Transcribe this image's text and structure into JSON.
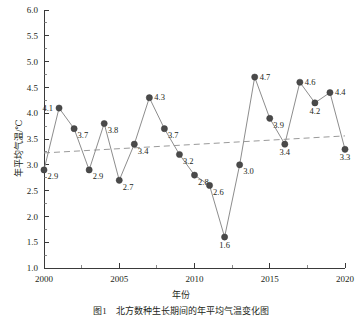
{
  "chart_data": {
    "type": "line",
    "title": "",
    "xlabel": "年份",
    "ylabel": "年平均气温/℃",
    "xlim": [
      2000,
      2020
    ],
    "ylim": [
      1.0,
      6.0
    ],
    "grid": false,
    "legend": "none",
    "x": [
      2000,
      2001,
      2002,
      2003,
      2004,
      2005,
      2006,
      2007,
      2008,
      2009,
      2010,
      2011,
      2012,
      2013,
      2014,
      2015,
      2016,
      2017,
      2018,
      2019,
      2020
    ],
    "series": [
      {
        "name": "年平均气温",
        "values": [
          2.9,
          4.1,
          3.7,
          2.9,
          3.8,
          2.7,
          3.4,
          4.3,
          3.7,
          3.2,
          2.8,
          2.6,
          1.6,
          3.0,
          4.7,
          3.9,
          3.4,
          4.6,
          4.2,
          4.4,
          3.3
        ],
        "marker": "filled-circle",
        "color": "#4a4a4a",
        "line_color": "#8d8d8d"
      },
      {
        "name": "线性趋势线",
        "type": "trend",
        "style": "dashed",
        "color": "#9a9a9a",
        "endpoints": [
          {
            "x": 2000,
            "y": 3.23
          },
          {
            "x": 2020,
            "y": 3.56
          }
        ]
      }
    ],
    "point_labels": [
      "2.9",
      "4.1",
      "3.7",
      "2.9",
      "3.8",
      "2.7",
      "3.4",
      "4.3",
      "3.7",
      "3.2",
      "2.8",
      "2.6",
      "1.6",
      "3.0",
      "4.7",
      "3.9",
      "3.4",
      "4.6",
      "4.2",
      "4.4",
      "3.3"
    ],
    "label_placement": [
      "right-below",
      "left",
      "right-below",
      "right-below",
      "right-below",
      "right-below",
      "right-below",
      "right",
      "right-below",
      "right-below",
      "right-below",
      "right-below",
      "below",
      "right-below",
      "right",
      "right-below",
      "below",
      "right",
      "below",
      "right",
      "below"
    ],
    "yticks": [
      "1.0",
      "1.5",
      "2.0",
      "2.5",
      "3.0",
      "3.5",
      "4.0",
      "4.5",
      "5.0",
      "5.5",
      "6.0"
    ],
    "ytick_values": [
      1.0,
      1.5,
      2.0,
      2.5,
      3.0,
      3.5,
      4.0,
      4.5,
      5.0,
      5.5,
      6.0
    ],
    "xticks": [
      "2000",
      "2005",
      "2010",
      "2015",
      "2020"
    ],
    "xtick_values": [
      2000,
      2005,
      2010,
      2015,
      2020
    ]
  },
  "figure": {
    "caption": "图1　北方数种生长期间的年平均气温变化图",
    "x_axis_title": "年份",
    "y_axis_title": "年平均气温/℃"
  }
}
